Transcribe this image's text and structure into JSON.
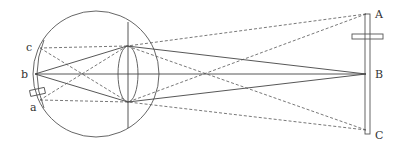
{
  "diagram": {
    "object_labels": {
      "A": "A",
      "B": "B",
      "C": "C"
    },
    "retina_labels": {
      "a": "a",
      "b": "b",
      "c": "c"
    },
    "eye": {
      "cx": 96,
      "cy": 74,
      "r": 63
    },
    "lens": {
      "cx": 128,
      "cy": 74,
      "rx": 10,
      "ry": 28
    },
    "points": {
      "A": [
        366,
        14
      ],
      "B": [
        366,
        74
      ],
      "C": [
        366,
        130
      ],
      "a": [
        40,
        100
      ],
      "b": [
        35,
        74
      ],
      "c": [
        40,
        48
      ],
      "lens_top": [
        127,
        46
      ],
      "lens_bottom": [
        128,
        102
      ]
    },
    "ray_styles": {
      "B": "solid",
      "A": "dashed",
      "C": "dashed"
    },
    "colors": {
      "line": "#444444",
      "text": "#333333",
      "background": "#ffffff"
    }
  }
}
